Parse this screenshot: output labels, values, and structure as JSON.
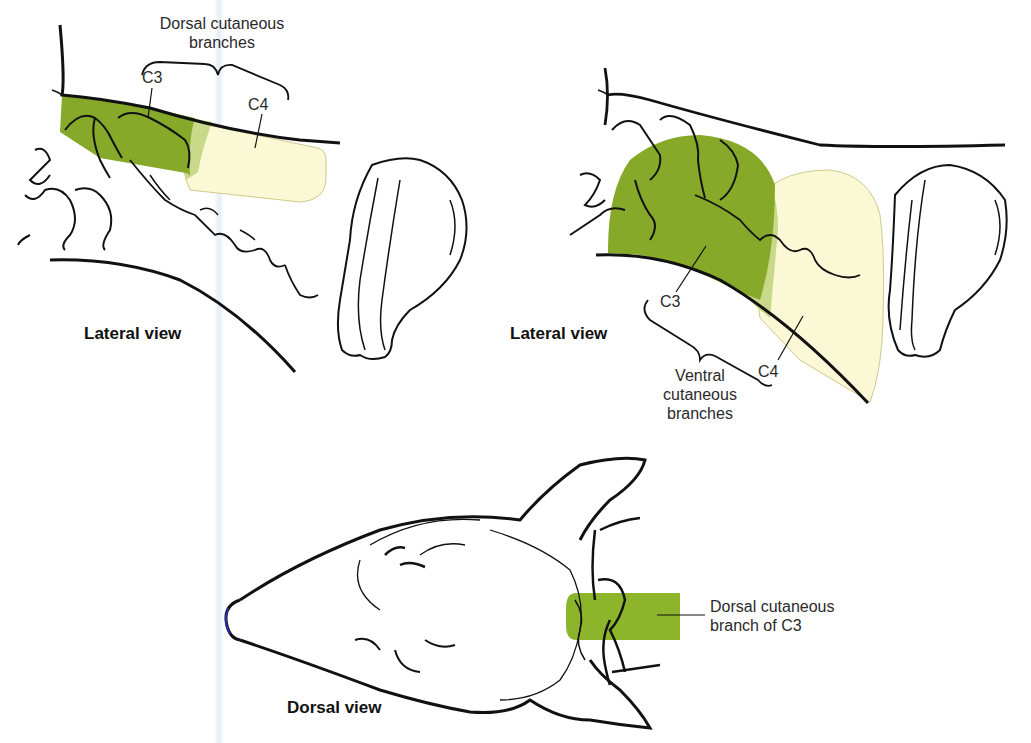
{
  "figure": {
    "panels": [
      {
        "id": "lateral-left",
        "view_label": "Lateral view",
        "group_label": "Dorsal cutaneous branches",
        "group_label_lines": [
          "Dorsal cutaneous",
          "branches"
        ],
        "regions": [
          {
            "name": "C3",
            "color": "#86a92a"
          },
          {
            "name": "C4",
            "color": "#fbf8d6"
          },
          {
            "name": "overlap",
            "color": "#c8d98a"
          }
        ]
      },
      {
        "id": "lateral-right",
        "view_label": "Lateral view",
        "group_label": "Ventral cutaneous branches",
        "group_label_lines": [
          "Ventral",
          "cutaneous",
          "branches"
        ],
        "regions": [
          {
            "name": "C3",
            "color": "#86a92a"
          },
          {
            "name": "C4",
            "color": "#fbf8d6"
          },
          {
            "name": "overlap",
            "color": "#c8d98a"
          }
        ]
      },
      {
        "id": "dorsal",
        "view_label": "Dorsal view",
        "callout": "Dorsal cutaneous branch of C3",
        "callout_lines": [
          "Dorsal cutaneous",
          "branch of C3"
        ],
        "regions": [
          {
            "name": "C3",
            "color": "#8db52c"
          }
        ]
      }
    ],
    "labels": {
      "c3": "C3",
      "c4": "C4"
    },
    "colors": {
      "c3_green": "#86a92a",
      "c4_cream": "#fbf8d6",
      "overlap": "#c8d98a",
      "outline": "#111111"
    }
  }
}
